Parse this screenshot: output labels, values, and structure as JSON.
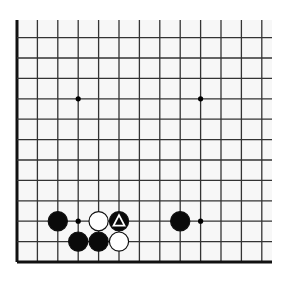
{
  "diagram": {
    "type": "go-board-fragment",
    "board_bg": "#f7f7f7",
    "line_color": "#333333",
    "edge_color": "#111111",
    "grid": {
      "x_origin": 17,
      "y_bottom": 262,
      "spacing": 20.4,
      "columns": 13,
      "rows": 12,
      "left_edge": true,
      "bottom_edge": true,
      "top_open_y": 20,
      "right_open_x": 272
    },
    "hoshi": [
      {
        "col": 3,
        "row": 9
      },
      {
        "col": 9,
        "row": 9
      },
      {
        "col": 3,
        "row": 3
      },
      {
        "col": 9,
        "row": 3
      }
    ],
    "stones": [
      {
        "color": "black",
        "col": 2,
        "row": 3,
        "marker": ""
      },
      {
        "color": "white",
        "col": 4,
        "row": 3,
        "marker": ""
      },
      {
        "color": "black",
        "col": 5,
        "row": 3,
        "marker": "triangle"
      },
      {
        "color": "black",
        "col": 3,
        "row": 2,
        "marker": ""
      },
      {
        "color": "black",
        "col": 4,
        "row": 2,
        "marker": ""
      },
      {
        "color": "white",
        "col": 5,
        "row": 2,
        "marker": ""
      },
      {
        "color": "black",
        "col": 8,
        "row": 3,
        "marker": ""
      }
    ],
    "last_move_marker": "triangle-icon"
  }
}
